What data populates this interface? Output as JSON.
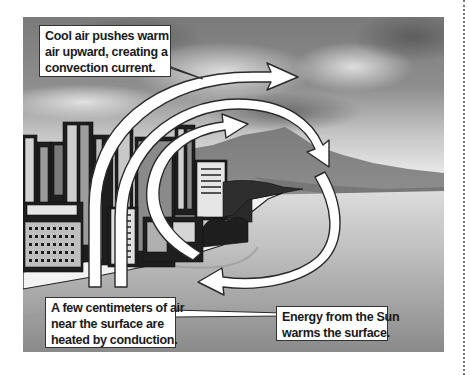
{
  "figure": {
    "colors": {
      "sky_dark": "#6e6e6e",
      "sky_light": "#e4e4e4",
      "mountain": "#8c8c8c",
      "water": "#b0b0b0",
      "buildings": "#222222",
      "arrow_fill": "#ffffff",
      "arrow_stroke": "#2a2a2a",
      "label_border": "#333333"
    }
  },
  "labels": {
    "cool_air": {
      "lines": [
        "Cool air pushes warm",
        "air upward, creating a",
        "convection current."
      ]
    },
    "conduction": {
      "lines": [
        "A few centimeters of air",
        "near the surface are",
        "heated by conduction."
      ]
    },
    "sun_energy": {
      "lines": [
        "Energy from the Sun",
        "warms the surface."
      ]
    }
  }
}
